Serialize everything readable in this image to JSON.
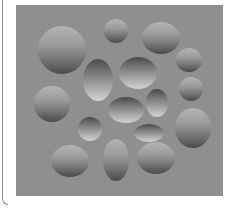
{
  "figure": {
    "background_color": "#8f8f8f",
    "panel": {
      "x": 16,
      "y": 5,
      "width": 207,
      "height": 191
    },
    "shapes": [
      {
        "type": "convex",
        "cx": 62,
        "cy": 50,
        "rx": 24,
        "ry": 24
      },
      {
        "type": "convex",
        "cx": 116,
        "cy": 31,
        "rx": 12,
        "ry": 12
      },
      {
        "type": "convex",
        "cx": 161,
        "cy": 38,
        "rx": 19,
        "ry": 16
      },
      {
        "type": "convex",
        "cx": 189,
        "cy": 60,
        "rx": 13,
        "ry": 12
      },
      {
        "type": "convex",
        "cx": 191,
        "cy": 89,
        "rx": 12,
        "ry": 12
      },
      {
        "type": "convex",
        "cx": 193,
        "cy": 128,
        "rx": 18,
        "ry": 20
      },
      {
        "type": "convex",
        "cx": 52,
        "cy": 104,
        "rx": 18,
        "ry": 18
      },
      {
        "type": "convex",
        "cx": 70,
        "cy": 161,
        "rx": 19,
        "ry": 16
      },
      {
        "type": "convex",
        "cx": 116,
        "cy": 160,
        "rx": 13,
        "ry": 21
      },
      {
        "type": "convex",
        "cx": 156,
        "cy": 158,
        "rx": 19,
        "ry": 16
      },
      {
        "type": "concave",
        "cx": 98,
        "cy": 80,
        "rx": 15,
        "ry": 21
      },
      {
        "type": "concave",
        "cx": 138,
        "cy": 73,
        "rx": 19,
        "ry": 16
      },
      {
        "type": "concave",
        "cx": 126,
        "cy": 110,
        "rx": 18,
        "ry": 13
      },
      {
        "type": "concave",
        "cx": 157,
        "cy": 103,
        "rx": 11,
        "ry": 14
      },
      {
        "type": "concave",
        "cx": 90,
        "cy": 129,
        "rx": 12,
        "ry": 12
      },
      {
        "type": "concave",
        "cx": 149,
        "cy": 133,
        "rx": 15,
        "ry": 9
      }
    ]
  }
}
